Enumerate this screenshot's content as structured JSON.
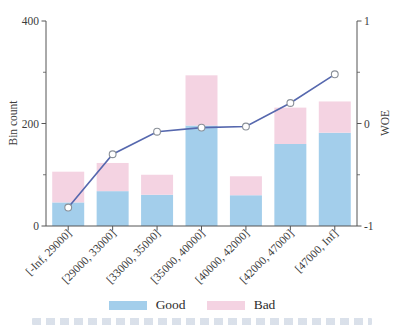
{
  "chart_data": {
    "type": "bar",
    "subtype": "stacked-bars-with-line",
    "title": "",
    "xlabel": "",
    "ylabel": "Bin count",
    "ylabel_right": "WOE",
    "categories": [
      "[-Inf, 29000]",
      "[29000, 33000]",
      "[33000, 35000]",
      "[35000, 40000]",
      "[40000, 42000]",
      "[42000, 47000]",
      "[47000, Inf]"
    ],
    "series": [
      {
        "name": "Good",
        "type": "bar",
        "stack": "bins",
        "axis": "left",
        "color": "#A3CEEB",
        "values": [
          46,
          68,
          61,
          196,
          60,
          160,
          182
        ]
      },
      {
        "name": "Bad",
        "type": "bar",
        "stack": "bins",
        "axis": "left",
        "color": "#F4D3E2",
        "values": [
          60,
          55,
          39,
          98,
          37,
          71,
          61
        ]
      },
      {
        "name": "WOE",
        "type": "line",
        "axis": "right",
        "color": "#5668AE",
        "marker": "open-circle",
        "values": [
          -0.82,
          -0.3,
          -0.08,
          -0.04,
          -0.03,
          0.2,
          0.48
        ]
      }
    ],
    "ylim": [
      0,
      400
    ],
    "yticks_labeled": [
      0,
      200,
      400
    ],
    "yticks_minor": [
      100,
      300
    ],
    "ylim_right": [
      -1,
      1
    ],
    "yticks_right_labeled": [
      -1,
      0,
      1
    ],
    "yticks_right_minor": [
      -0.5,
      0.5
    ],
    "grid": false,
    "legend_position": "bottom",
    "x_tick_label_rotation_deg": 45
  },
  "legend": {
    "good_label": "Good",
    "bad_label": "Bad"
  },
  "colors": {
    "good": "#A3CEEB",
    "bad": "#F4D3E2",
    "line": "#5668AE",
    "marker_fill": "#FFFFFF",
    "marker_edge": "#8A9098",
    "axis": "#555555",
    "text": "#3C3C3C"
  }
}
